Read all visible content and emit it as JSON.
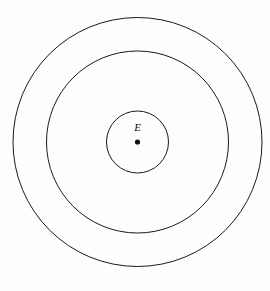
{
  "figure": {
    "background_color": "#fdfdfd",
    "stroke_color": "#1a1a1a",
    "label_color": "#111111",
    "center_label": "E",
    "center_point_label": "center-point"
  },
  "chart_data": {
    "type": "diagram",
    "title": "",
    "subtitle": "",
    "xlabel": "",
    "ylabel": "",
    "grid": false,
    "legend": "none",
    "annotations": [
      {
        "text": "E",
        "x": 137.5,
        "y": 131,
        "style": "italic",
        "font_size_px": 11
      }
    ],
    "center": {
      "x": 137.5,
      "y": 142
    },
    "center_dot": {
      "name": "center-dot",
      "cx": 137.5,
      "cy": 142,
      "r": 2.6,
      "fill": "#111111"
    },
    "circles": [
      {
        "name": "inner-circle",
        "cx": 137.5,
        "cy": 142,
        "r": 31,
        "stroke": "#1a1a1a",
        "stroke_width": 1,
        "fill": "none"
      },
      {
        "name": "middle-circle",
        "cx": 137.5,
        "cy": 142,
        "r": 91,
        "stroke": "#1a1a1a",
        "stroke_width": 1,
        "fill": "none"
      },
      {
        "name": "outer-circle",
        "cx": 137.5,
        "cy": 142,
        "r": 124.5,
        "stroke": "#1a1a1a",
        "stroke_width": 1,
        "fill": "none"
      }
    ]
  }
}
